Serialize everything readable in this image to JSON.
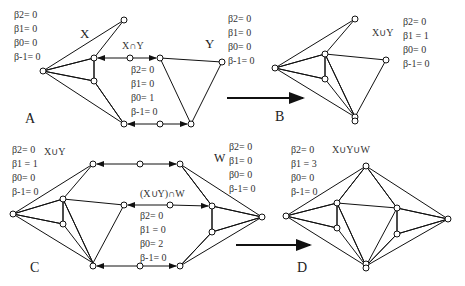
{
  "panels": {
    "A": {
      "label": "A",
      "X": {
        "name": "X",
        "betas": [
          "β2= 0",
          "β1= 0",
          "β0= 0",
          "β-1= 0"
        ]
      },
      "Y": {
        "name": "Y",
        "betas": [
          "β2= 0",
          "β1= 0",
          "β0= 0",
          "β-1= 0"
        ]
      },
      "intersection": {
        "name": "X∩Y",
        "betas": [
          "β2= 0",
          "β1= 0",
          "β0= 1",
          "β-1= 0"
        ]
      }
    },
    "B": {
      "label": "B",
      "union": {
        "name": "X∪Y",
        "betas": [
          "β2= 0",
          "β1 = 1",
          "β0= 0",
          "β-1= 0"
        ]
      }
    },
    "C": {
      "label": "C",
      "union": {
        "name": "X∪Y",
        "betas": [
          "β2= 0",
          "β1 = 1",
          "β0= 0",
          "β-1= 0"
        ]
      },
      "W": {
        "name": "W",
        "betas": [
          "β2= 0",
          "β1= 0",
          "β0= 0",
          "β-1= 0"
        ]
      },
      "intersection": {
        "name": "(X∪Y)∩W",
        "betas": [
          "β2= 0",
          "β1 = 0",
          "β0= 2",
          "β-1= 0"
        ]
      }
    },
    "D": {
      "label": "D",
      "union": {
        "name": "X∪Y∪W",
        "betas": [
          "β2= 0",
          "β1 = 3",
          "β0= 0",
          "β-1= 0"
        ]
      }
    }
  },
  "colors": {
    "ink": "#111111",
    "background": "#ffffff"
  }
}
